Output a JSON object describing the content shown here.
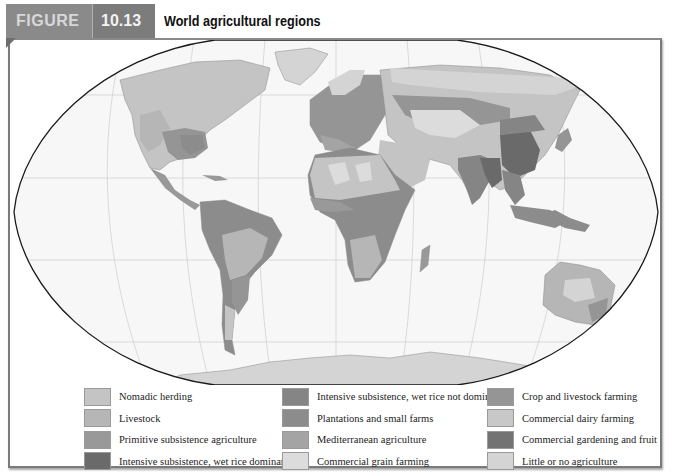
{
  "header": {
    "figure_label": "FIGURE",
    "figure_number": "10.13",
    "title": "World agricultural regions"
  },
  "colors": {
    "nomadic_herding": "#c4c4c4",
    "livestock": "#b6b6b6",
    "primitive_subsistence": "#999999",
    "wet_rice_dominant": "#6a6a6a",
    "wet_rice_not_dominant": "#858585",
    "plantations": "#8c8c8c",
    "mediterranean": "#a4a4a4",
    "commercial_grain": "#dcdcdc",
    "crop_livestock": "#959595",
    "dairy": "#c8c8c8",
    "gardening_fruit": "#737373",
    "little_none": "#d4d4d4",
    "ocean": "#f7f7f7",
    "grid": "#c6c6c6",
    "frame": "#7a7a7a"
  },
  "legend": {
    "columns": [
      [
        {
          "label": "Nomadic herding",
          "color": "#c4c4c4"
        },
        {
          "label": "Livestock",
          "color": "#b6b6b6"
        },
        {
          "label": "Primitive subsistence agriculture",
          "color": "#999999"
        },
        {
          "label": "Intensive subsistence, wet rice dominant",
          "color": "#6a6a6a"
        }
      ],
      [
        {
          "label": "Intensive subsistence, wet rice not dominant",
          "color": "#858585"
        },
        {
          "label": "Plantations and small farms",
          "color": "#8c8c8c"
        },
        {
          "label": "Mediterranean agriculture",
          "color": "#a4a4a4"
        },
        {
          "label": "Commercial grain farming",
          "color": "#dcdcdc"
        }
      ],
      [
        {
          "label": "Crop and livestock farming",
          "color": "#959595"
        },
        {
          "label": "Commercial dairy farming",
          "color": "#c8c8c8"
        },
        {
          "label": "Commercial gardening and fruit",
          "color": "#737373"
        },
        {
          "label": "Little or no agriculture",
          "color": "#d4d4d4"
        }
      ]
    ]
  },
  "map": {
    "projection": "Robinson",
    "subject": "World agricultural regions"
  }
}
